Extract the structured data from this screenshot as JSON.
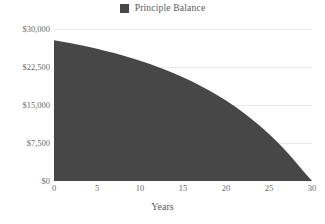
{
  "legend": {
    "position": "top-center",
    "entries": [
      {
        "label": "Principle Balance",
        "color": "#474747",
        "marker": "square-swatch"
      }
    ]
  },
  "axes": {
    "x_title": "Years",
    "y_title": "",
    "y_ticks": [
      "$0",
      "$7,500",
      "$15,000",
      "$22,500",
      "$30,000"
    ],
    "x_ticks": [
      "0",
      "5",
      "10",
      "15",
      "20",
      "25",
      "30"
    ]
  },
  "style": {
    "background": "#ffffff",
    "gridline_color": "#e9e9e9",
    "baseline_color": "#bdbdbd",
    "tick_text_color": "#6b6b6b",
    "legend_text_color": "#5a5a5a",
    "series_fill": "#474747"
  },
  "chart_data": {
    "type": "area",
    "title": "",
    "subtitle": "",
    "xlabel": "Years",
    "ylabel": "",
    "xlim": [
      0,
      30
    ],
    "ylim": [
      0,
      30000
    ],
    "grid": true,
    "legend_position": "top-center",
    "x_ticks": [
      0,
      5,
      10,
      15,
      20,
      25,
      30
    ],
    "y_ticks": [
      0,
      7500,
      15000,
      22500,
      30000
    ],
    "y_tick_labels": [
      "$0",
      "$7,500",
      "$15,000",
      "$22,500",
      "$30,000"
    ],
    "series": [
      {
        "name": "Principle Balance",
        "color": "#474747",
        "x": [
          0,
          1,
          2,
          3,
          4,
          5,
          6,
          7,
          8,
          9,
          10,
          11,
          12,
          13,
          14,
          15,
          16,
          17,
          18,
          19,
          20,
          21,
          22,
          23,
          24,
          25,
          26,
          27,
          28,
          29,
          30
        ],
        "values": [
          27800,
          27500,
          27180,
          26840,
          26480,
          26090,
          25680,
          25240,
          24770,
          24270,
          23740,
          23170,
          22560,
          21910,
          21210,
          20470,
          19670,
          18820,
          17900,
          16920,
          15870,
          14740,
          13520,
          12210,
          10800,
          9280,
          7640,
          5870,
          3960,
          1900,
          0
        ]
      }
    ]
  }
}
